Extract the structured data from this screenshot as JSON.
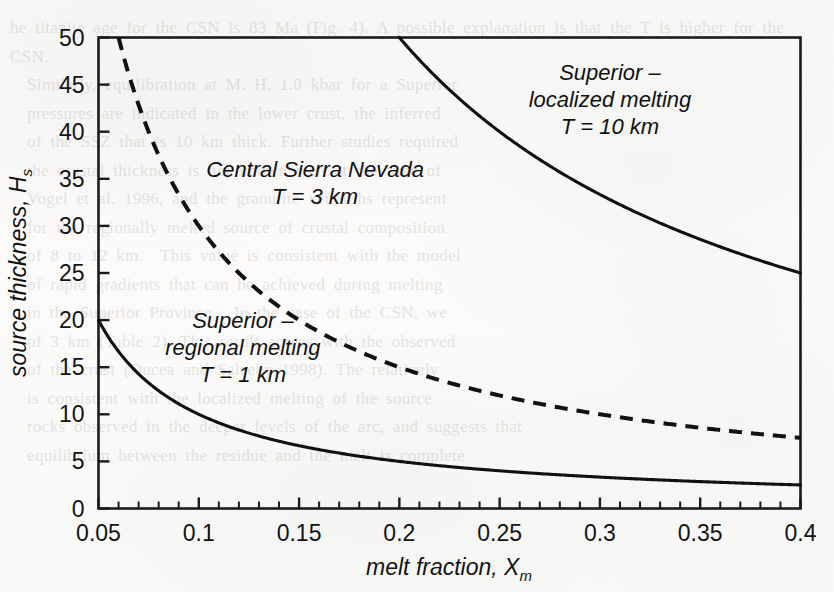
{
  "figure": {
    "background_color": "#fbfbfa",
    "ink_color": "#111111",
    "ghost_text": "he titanite age for the CSN is 83 Ma (Fig. 4). A possible explanation is that the T is higher for the CSN.\n  Similarly, equilibration at M. H. 1.0 kbar for a Superior\n  pressures are indicated in the lower crust, the inferred\n  of the SSZ that is 10 km thick. Further studies required\n  the crustal thickness is not known well at the time of\n  Vogel et al. 1996, and the granulite xenoliths represent\n  for the regionally melted source of crustal composition\n  of 8 to 12 km.  This value is consistent with the model\n  of rapid gradients that can be achieved during melting\n  in the Superior Province.  In the case of the CSN, we\n  of 3 km (Table 2). This result agrees with the observed\n  of the crust (Ducea and Saleeby 1998). The relatively\n  is consistent with the localized melting of the source\n  rocks observed in the deeper levels of the arc, and suggests that\n  equilibrium between the residue and the melt is complete"
  },
  "chart_data": {
    "type": "line",
    "title": "",
    "xlabel": "melt fraction, X",
    "xlabel_sub": "m",
    "ylabel": "source thickness, H",
    "ylabel_sub": "s",
    "xlim": [
      0.05,
      0.4
    ],
    "ylim": [
      0,
      50
    ],
    "xticks": [
      0.05,
      0.1,
      0.15,
      0.2,
      0.25,
      0.3,
      0.35,
      0.4
    ],
    "xtick_labels": [
      "0.05",
      "0.1",
      "0.15",
      "0.2",
      "0.25",
      "0.3",
      "0.35",
      "0.4"
    ],
    "xminor_step": 0.01,
    "yticks": [
      0,
      5,
      10,
      15,
      20,
      25,
      30,
      35,
      40,
      45,
      50
    ],
    "ytick_labels": [
      "0",
      "5",
      "10",
      "15",
      "20",
      "25",
      "30",
      "35",
      "40",
      "45",
      "50"
    ],
    "grid": false,
    "legend": "none",
    "relation": "H_s = T / X_m",
    "series": [
      {
        "name": "Superior - localized melting, T = 10 km",
        "T_km": 10,
        "style": "solid",
        "annotation_lines": [
          "Superior –",
          "localized melting",
          "T = 10 km"
        ],
        "x": [
          0.2,
          0.21,
          0.22,
          0.23,
          0.24,
          0.25,
          0.26,
          0.27,
          0.28,
          0.29,
          0.3,
          0.31,
          0.32,
          0.33,
          0.34,
          0.35,
          0.36,
          0.37,
          0.38,
          0.39,
          0.4
        ],
        "y": [
          50.0,
          47.6,
          45.5,
          43.5,
          41.7,
          40.0,
          38.5,
          37.0,
          35.7,
          34.5,
          33.3,
          32.3,
          31.3,
          30.3,
          29.4,
          28.6,
          27.8,
          27.0,
          26.3,
          25.6,
          25.0
        ]
      },
      {
        "name": "Central Sierra Nevada, T = 3 km",
        "T_km": 3,
        "style": "dashed",
        "annotation_lines": [
          "Central Sierra Nevada",
          "T = 3 km"
        ],
        "x": [
          0.06,
          0.07,
          0.08,
          0.09,
          0.1,
          0.12,
          0.14,
          0.16,
          0.18,
          0.2,
          0.22,
          0.24,
          0.26,
          0.28,
          0.3,
          0.32,
          0.34,
          0.36,
          0.38,
          0.4
        ],
        "y": [
          50.0,
          42.9,
          37.5,
          33.3,
          30.0,
          25.0,
          21.4,
          18.8,
          16.7,
          15.0,
          13.6,
          12.5,
          11.5,
          10.7,
          10.0,
          9.4,
          8.8,
          8.3,
          7.9,
          7.5
        ]
      },
      {
        "name": "Superior - regional melting, T = 1 km",
        "T_km": 1,
        "style": "solid",
        "annotation_lines": [
          "Superior –",
          "regional melting",
          "T = 1 km"
        ],
        "x": [
          0.05,
          0.06,
          0.07,
          0.08,
          0.09,
          0.1,
          0.12,
          0.14,
          0.16,
          0.18,
          0.2,
          0.22,
          0.24,
          0.26,
          0.28,
          0.3,
          0.32,
          0.34,
          0.36,
          0.38,
          0.4
        ],
        "y": [
          20.0,
          16.7,
          14.3,
          12.5,
          11.1,
          10.0,
          8.3,
          7.1,
          6.3,
          5.6,
          5.0,
          4.5,
          4.2,
          3.8,
          3.6,
          3.3,
          3.1,
          2.9,
          2.8,
          2.6,
          2.5
        ]
      }
    ],
    "annotations": [
      {
        "id": "superior-localized",
        "lines": [
          "Superior –",
          "localized melting",
          "T = 10 km"
        ],
        "x_data": 0.305,
        "y_data": 45.5
      },
      {
        "id": "central-sierra-nevada",
        "lines": [
          "Central Sierra Nevada",
          "T = 3 km"
        ],
        "x_data": 0.158,
        "y_data": 35.2
      },
      {
        "id": "superior-regional",
        "lines": [
          "Superior –",
          "regional melting",
          "T = 1 km"
        ],
        "x_data": 0.122,
        "y_data": 19.2
      }
    ]
  }
}
